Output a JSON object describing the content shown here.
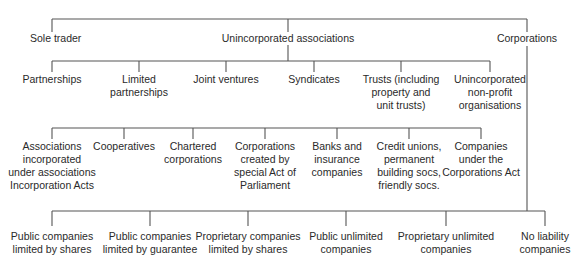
{
  "diagram": {
    "level1": [
      {
        "id": "sole-trader",
        "label": "Sole trader",
        "x": 52,
        "y": 32,
        "align": "left",
        "offset": -22
      },
      {
        "id": "unincorporated-associations",
        "label": "Unincorporated associations",
        "x": 288,
        "y": 32
      },
      {
        "id": "corporations",
        "label": "Corporations",
        "x": 527,
        "y": 32
      }
    ],
    "unincorporated_children": [
      {
        "id": "partnerships",
        "label": "Partnerships",
        "x": 52,
        "y": 73
      },
      {
        "id": "limited-partnerships",
        "label": "Limited\npartnerships",
        "x": 139,
        "y": 73
      },
      {
        "id": "joint-ventures",
        "label": "Joint ventures",
        "x": 226,
        "y": 73
      },
      {
        "id": "syndicates",
        "label": "Syndicates",
        "x": 314,
        "y": 73
      },
      {
        "id": "trusts",
        "label": "Trusts (including\nproperty and\nunit trusts)",
        "x": 401,
        "y": 73
      },
      {
        "id": "unincorporated-non-profit",
        "label": "Unincorporated\nnon-profit\norganisations",
        "x": 490,
        "y": 73
      }
    ],
    "corporation_types": [
      {
        "id": "associations-incorporated",
        "label": "Associations\nincorporated\nunder associations\nIncorporation Acts",
        "x": 52,
        "y": 140
      },
      {
        "id": "cooperatives",
        "label": "Cooperatives",
        "x": 124,
        "y": 140
      },
      {
        "id": "chartered-corporations",
        "label": "Chartered\ncorporations",
        "x": 193,
        "y": 140
      },
      {
        "id": "special-act-corporations",
        "label": "Corporations\ncreated by\nspecial Act of\nParliament",
        "x": 265,
        "y": 140
      },
      {
        "id": "banks-insurance",
        "label": "Banks and\ninsurance\ncompanies",
        "x": 337,
        "y": 140
      },
      {
        "id": "credit-unions",
        "label": "Credit unions,\npermanent\nbuilding socs,\nfriendly socs.",
        "x": 409,
        "y": 140
      },
      {
        "id": "corporations-act-companies",
        "label": "Companies\nunder the\nCorporations Act",
        "x": 481,
        "y": 140
      }
    ],
    "company_types": [
      {
        "id": "public-limited-shares",
        "label": "Public companies\nlimited by shares",
        "x": 52,
        "y": 230
      },
      {
        "id": "public-limited-guarantee",
        "label": "Public companies\nlimited by guarantee",
        "x": 150,
        "y": 230
      },
      {
        "id": "proprietary-limited-shares",
        "label": "Proprietary companies\nlimited by shares",
        "x": 248,
        "y": 230
      },
      {
        "id": "public-unlimited",
        "label": "Public unlimited\ncompanies",
        "x": 346,
        "y": 230
      },
      {
        "id": "proprietary-unlimited",
        "label": "Proprietary unlimited\ncompanies",
        "x": 446,
        "y": 230
      },
      {
        "id": "no-liability",
        "label": "No liability\ncompanies",
        "x": 545,
        "y": 230
      }
    ],
    "line_color": "#555555"
  }
}
